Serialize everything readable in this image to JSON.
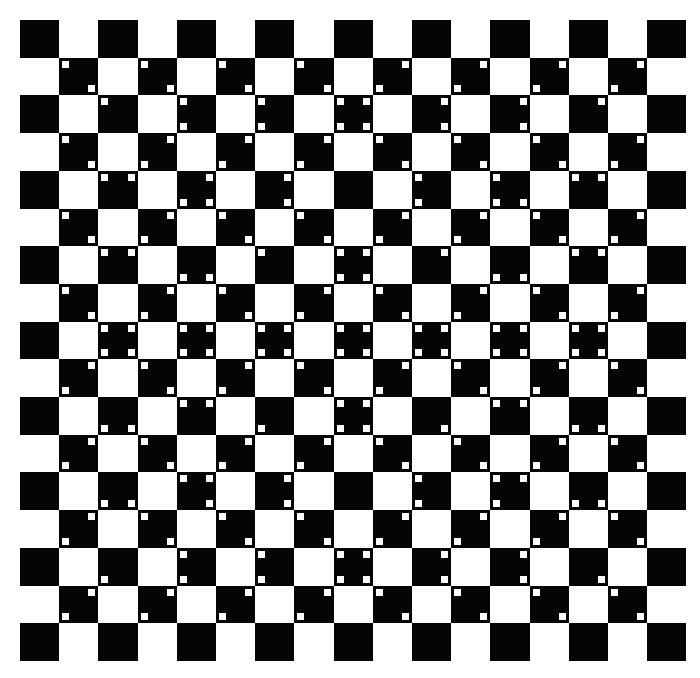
{
  "board": {
    "rows": 17,
    "cols": 17,
    "left": 20,
    "top": 20,
    "cell_width": 39.2,
    "cell_height": 37.7,
    "dot_size": 7,
    "dot_inset": 3,
    "colors": {
      "dark": "#050505",
      "light": "#ffffff",
      "dot": "#ffffff"
    },
    "black_rule": "(row + col) is even",
    "dots": {
      "1": {
        "1": "TL,BR",
        "3": "TL,BR",
        "5": "TL,BR",
        "7": "TL,BR",
        "9": "TR,BL",
        "11": "TR,BL",
        "13": "TR,BL",
        "15": "TR,BL"
      },
      "2": {
        "2": "TL",
        "4": "TL,BL",
        "6": "TL,BL",
        "8": "TL,TR,BL,BR",
        "10": "TR,BR",
        "12": "TR,BR",
        "14": "TR"
      },
      "3": {
        "1": "TL,BR",
        "3": "TR,BL",
        "5": "TR,BL",
        "7": "TR,BL",
        "9": "TL,BR",
        "11": "TL,BR",
        "13": "TL,BR",
        "15": "TR,BL"
      },
      "4": {
        "2": "TL,TR",
        "4": "TR,BL,BR",
        "6": "TR,BR",
        "10": "TL,BL",
        "12": "TL,BL,BR",
        "14": "TL,TR"
      },
      "5": {
        "1": "TL,BR",
        "3": "TR,BL",
        "5": "TL,BR",
        "7": "TL,BR",
        "9": "TR,BL",
        "11": "TR,BL",
        "13": "TL,BR",
        "15": "TR,BL"
      },
      "6": {
        "2": "TL,TR",
        "4": "BL,BR",
        "6": "TL",
        "8": "TL,TR,BL,BR",
        "10": "TR",
        "12": "BL,BR",
        "14": "TL,TR"
      },
      "7": {
        "1": "TL,BR",
        "3": "TR,BL",
        "5": "TL,BR",
        "7": "TR,BL",
        "9": "TL,BR",
        "11": "TR,BL",
        "13": "TL,BR",
        "15": "TR,BL"
      },
      "8": {
        "2": "TL,TR,BL,BR",
        "4": "TL,TR,BL,BR",
        "6": "TL,TR,BL,BR",
        "8": "TL,TR,BL,BR",
        "10": "TL,TR,BL,BR",
        "12": "TL,TR,BL,BR",
        "14": "TL,TR,BL,BR"
      },
      "9": {
        "1": "TR,BL",
        "3": "TL,BR",
        "5": "TR,BL",
        "7": "TL,BR",
        "9": "TR,BL",
        "11": "TL,BR",
        "13": "TR,BL",
        "15": "TL,BR"
      },
      "10": {
        "2": "BL,BR",
        "4": "TL,TR",
        "6": "BL",
        "8": "TL,TR,BL,BR",
        "10": "BR",
        "12": "TL,TR",
        "14": "BL,BR"
      },
      "11": {
        "1": "TR,BL",
        "3": "TL,BR",
        "5": "TR,BL",
        "7": "TR,BL",
        "9": "TL,BR",
        "11": "TL,BR",
        "13": "TR,BL",
        "15": "TL,BR"
      },
      "12": {
        "2": "BL,BR",
        "4": "TL,TR,BR",
        "6": "TR,BR",
        "10": "TL,BL",
        "12": "TL,TR,BL",
        "14": "BL,BR"
      },
      "13": {
        "1": "TR,BL",
        "3": "TL,BR",
        "5": "TL,BR",
        "7": "TL,BR",
        "9": "TR,BL",
        "11": "TR,BL",
        "13": "TR,BL",
        "15": "TL,BR"
      },
      "14": {
        "2": "BL",
        "4": "TL,BL",
        "6": "TL,BL",
        "8": "TL,TR,BL,BR",
        "10": "TR,BR",
        "12": "TR,BR",
        "14": "BR"
      },
      "15": {
        "1": "TR,BL",
        "3": "TR,BL",
        "5": "TR,BL",
        "7": "TR,BL",
        "9": "TL,BR",
        "11": "TL,BR",
        "13": "TL,BR",
        "15": "TL,BR"
      }
    }
  }
}
